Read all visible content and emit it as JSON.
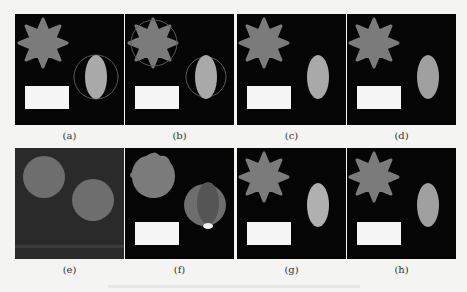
{
  "figure": {
    "panels": [
      {
        "id": "a",
        "label": "(a)",
        "content": "star, ellipse with circular contour, rectangle"
      },
      {
        "id": "b",
        "label": "(b)",
        "content": "star with contour, ellipse with contour, rectangle"
      },
      {
        "id": "c",
        "label": "(c)",
        "content": "star, ellipse, rectangle"
      },
      {
        "id": "d",
        "label": "(d)",
        "content": "star, ellipse, rectangle"
      },
      {
        "id": "e",
        "label": "(e)",
        "content": "two gray circles on dark gray background"
      },
      {
        "id": "f",
        "label": "(f)",
        "content": "rough circle, circle with ellipse overlay, rectangle"
      },
      {
        "id": "g",
        "label": "(g)",
        "content": "star, ellipse, rectangle"
      },
      {
        "id": "h",
        "label": "(h)",
        "content": "star, ellipse, rectangle"
      }
    ],
    "colors": {
      "background": "#050505",
      "star": "#7b7b7b",
      "ellipse": "#a9a9a9",
      "rectangle": "#f5f5f5",
      "contour": "#6a6a6a",
      "panel_e_background": "#2a2a2a",
      "panel_e_circle": "#6e6e6e"
    }
  }
}
